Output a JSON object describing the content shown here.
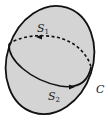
{
  "diagram": {
    "surface_fill": "#d4d4d4",
    "stroke": "#111111",
    "labels": {
      "s1": "S",
      "s1_sub": "1",
      "s2": "S",
      "s2_sub": "2",
      "curve": "C"
    }
  }
}
